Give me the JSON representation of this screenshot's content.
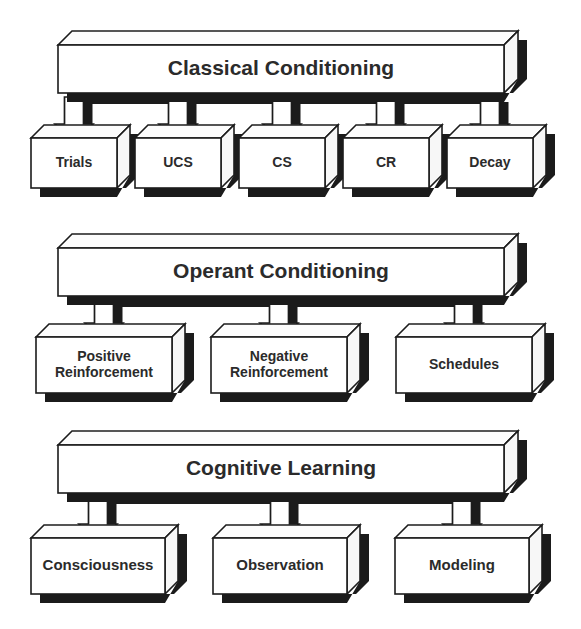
{
  "diagram": {
    "title_semantic": "Learning Theories Hierarchy",
    "style": {
      "face_color": "#ffffff",
      "outline_color": "#1c1c1c",
      "shadow_color": "#1b1b1b",
      "text_color": "#2b2b2b",
      "background": "#ffffff"
    },
    "sections": [
      {
        "id": "classical-conditioning",
        "header": {
          "label": "Classical Conditioning",
          "font_size": 21,
          "x": 58,
          "y": 45,
          "w": 446,
          "h": 48,
          "depth": 14
        },
        "children": [
          {
            "label": "Trials",
            "x": 31,
            "y": 138,
            "w": 86,
            "h": 50,
            "depth": 13,
            "font_size": 14,
            "lines": 1
          },
          {
            "label": "UCS",
            "x": 135,
            "y": 138,
            "w": 86,
            "h": 50,
            "depth": 13,
            "font_size": 14,
            "lines": 1
          },
          {
            "label": "CS",
            "x": 239,
            "y": 138,
            "w": 86,
            "h": 50,
            "depth": 13,
            "font_size": 14,
            "lines": 1
          },
          {
            "label": "CR",
            "x": 343,
            "y": 138,
            "w": 86,
            "h": 50,
            "depth": 13,
            "font_size": 14,
            "lines": 1
          },
          {
            "label": "Decay",
            "x": 447,
            "y": 138,
            "w": 86,
            "h": 50,
            "depth": 13,
            "font_size": 14,
            "lines": 1
          }
        ]
      },
      {
        "id": "operant-conditioning",
        "header": {
          "label": "Operant Conditioning",
          "font_size": 21,
          "x": 58,
          "y": 248,
          "w": 446,
          "h": 48,
          "depth": 14
        },
        "children": [
          {
            "label": "Positive\nReinforcement",
            "x": 36,
            "y": 337,
            "w": 136,
            "h": 56,
            "depth": 13,
            "font_size": 14,
            "lines": 2
          },
          {
            "label": "Negative\nReinforcement",
            "x": 211,
            "y": 337,
            "w": 136,
            "h": 56,
            "depth": 13,
            "font_size": 14,
            "lines": 2
          },
          {
            "label": "Schedules",
            "x": 396,
            "y": 337,
            "w": 136,
            "h": 56,
            "depth": 13,
            "font_size": 14,
            "lines": 1
          }
        ]
      },
      {
        "id": "cognitive-learning",
        "header": {
          "label": "Cognitive Learning",
          "font_size": 21,
          "x": 58,
          "y": 445,
          "w": 446,
          "h": 48,
          "depth": 14
        },
        "children": [
          {
            "label": "Consciousness",
            "x": 31,
            "y": 538,
            "w": 134,
            "h": 56,
            "depth": 13,
            "font_size": 15,
            "lines": 1
          },
          {
            "label": "Observation",
            "x": 213,
            "y": 538,
            "w": 134,
            "h": 56,
            "depth": 13,
            "font_size": 15,
            "lines": 1
          },
          {
            "label": "Modeling",
            "x": 395,
            "y": 538,
            "w": 134,
            "h": 56,
            "depth": 13,
            "font_size": 15,
            "lines": 1
          }
        ]
      }
    ]
  }
}
